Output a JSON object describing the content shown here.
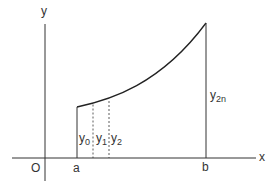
{
  "diagram": {
    "axes": {
      "x_label": "x",
      "y_label": "y",
      "origin_label": "O"
    },
    "interval": {
      "start_label": "a",
      "end_label": "b"
    },
    "ordinates": [
      {
        "label": "y",
        "sub": "0",
        "style": "solid"
      },
      {
        "label": "y",
        "sub": "1",
        "style": "dashed"
      },
      {
        "label": "y",
        "sub": "2",
        "style": "dashed"
      },
      {
        "label": "y",
        "sub": "2n",
        "style": "solid"
      }
    ],
    "colors": {
      "line": "#333333",
      "background": "#ffffff"
    }
  }
}
